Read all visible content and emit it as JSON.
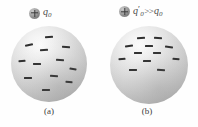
{
  "figure": {
    "width": 198,
    "height": 127,
    "background_color": "#fefefe",
    "sphere_color_light": "#fdfdfd",
    "sphere_color_dark": "#8f8f8f",
    "charge_mark_color": "#2e2e2e"
  },
  "panels": [
    {
      "id": "a",
      "caption": "(a)",
      "charge_icon": "plus-circle-icon",
      "charge_label": {
        "symbol": "q",
        "subscript": "0",
        "prime": "",
        "relation": "",
        "symbol2": "",
        "subscript2": "",
        "full_text": "q0"
      },
      "sphere": {
        "name": "conducting-sphere-a",
        "diameter": 76,
        "charge_sign": "minus",
        "distribution": "uniform",
        "charge_count": 12,
        "charges": [
          {
            "x": 50,
            "y": 14,
            "w": 8,
            "h": 2,
            "rot": -4
          },
          {
            "x": 24,
            "y": 25,
            "w": 8,
            "h": 2,
            "rot": -12
          },
          {
            "x": 72,
            "y": 28,
            "w": 8,
            "h": 2,
            "rot": 6
          },
          {
            "x": 44,
            "y": 32,
            "w": 8,
            "h": 2,
            "rot": -3
          },
          {
            "x": 14,
            "y": 46,
            "w": 7,
            "h": 2,
            "rot": -3
          },
          {
            "x": 64,
            "y": 45,
            "w": 8,
            "h": 2,
            "rot": 4
          },
          {
            "x": 34,
            "y": 50,
            "w": 8,
            "h": 2,
            "rot": 2
          },
          {
            "x": 82,
            "y": 56,
            "w": 7,
            "h": 2,
            "rot": 8
          },
          {
            "x": 22,
            "y": 68,
            "w": 8,
            "h": 2,
            "rot": -2
          },
          {
            "x": 56,
            "y": 66,
            "w": 8,
            "h": 2,
            "rot": 3
          },
          {
            "x": 76,
            "y": 74,
            "w": 7,
            "h": 2,
            "rot": 7
          },
          {
            "x": 46,
            "y": 84,
            "w": 8,
            "h": 2,
            "rot": 1
          }
        ]
      }
    },
    {
      "id": "b",
      "caption": "(b)",
      "charge_icon": "plus-circle-icon",
      "charge_label": {
        "symbol": "q",
        "subscript": "0",
        "prime": "′",
        "relation": ">>",
        "symbol2": "q",
        "subscript2": "0",
        "full_text": "q′0 >> q0"
      },
      "sphere": {
        "name": "conducting-sphere-b",
        "diameter": 78,
        "charge_sign": "minus",
        "distribution": "concentrated-top",
        "charge_count": 12,
        "charges": [
          {
            "x": 40,
            "y": 16,
            "w": 8,
            "h": 2,
            "rot": -3
          },
          {
            "x": 62,
            "y": 15,
            "w": 8,
            "h": 2,
            "rot": 3
          },
          {
            "x": 24,
            "y": 26,
            "w": 8,
            "h": 2,
            "rot": -8
          },
          {
            "x": 50,
            "y": 25,
            "w": 8,
            "h": 2,
            "rot": 0
          },
          {
            "x": 76,
            "y": 27,
            "w": 8,
            "h": 2,
            "rot": 7
          },
          {
            "x": 36,
            "y": 34,
            "w": 8,
            "h": 2,
            "rot": -2
          },
          {
            "x": 60,
            "y": 35,
            "w": 8,
            "h": 2,
            "rot": 2
          },
          {
            "x": 16,
            "y": 42,
            "w": 7,
            "h": 2,
            "rot": -6
          },
          {
            "x": 84,
            "y": 42,
            "w": 7,
            "h": 2,
            "rot": 6
          },
          {
            "x": 48,
            "y": 45,
            "w": 8,
            "h": 2,
            "rot": 1
          },
          {
            "x": 30,
            "y": 56,
            "w": 8,
            "h": 2,
            "rot": -2
          },
          {
            "x": 66,
            "y": 56,
            "w": 8,
            "h": 2,
            "rot": 3
          }
        ]
      }
    }
  ]
}
